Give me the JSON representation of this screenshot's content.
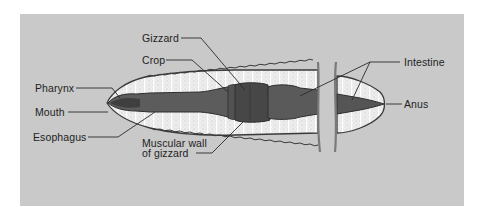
{
  "figure": {
    "background_color": "#c9c9c9",
    "labels": {
      "gizzard": "Gizzard",
      "crop": "Crop",
      "pharynx": "Pharynx",
      "mouth": "Mouth",
      "esophagus": "Esophagus",
      "muscular_wall_line1": "Muscular wall",
      "muscular_wall_line2": "of gizzard",
      "intestine": "Intestine",
      "anus": "Anus"
    },
    "colors": {
      "body_outline": "#3a3a3a",
      "body_fill": "#ececec",
      "gut_fill": "#5c5c5c",
      "gizzard_fill": "#474747",
      "cut_line": "#7a7a7a",
      "leader_line": "#2a2a2a"
    }
  }
}
